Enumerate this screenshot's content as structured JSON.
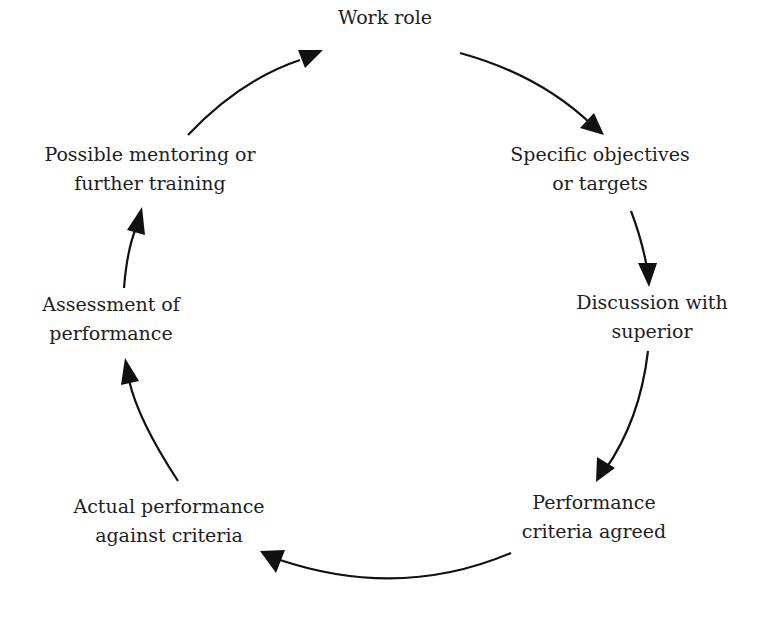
{
  "diagram": {
    "type": "cycle",
    "colors": {
      "background": "#ffffff",
      "text": "#1e1e1e",
      "arrow": "#111111"
    },
    "nodes": [
      {
        "id": "work-role",
        "lines": [
          "Work role"
        ]
      },
      {
        "id": "specific-objectives",
        "lines": [
          "Specific objectives",
          "or targets"
        ]
      },
      {
        "id": "discussion-superior",
        "lines": [
          "Discussion with",
          "superior"
        ]
      },
      {
        "id": "performance-criteria",
        "lines": [
          "Performance",
          "criteria agreed"
        ]
      },
      {
        "id": "actual-performance",
        "lines": [
          "Actual performance",
          "against criteria"
        ]
      },
      {
        "id": "assessment",
        "lines": [
          "Assessment of",
          "performance"
        ]
      },
      {
        "id": "mentoring",
        "lines": [
          "Possible mentoring or",
          "further training"
        ]
      }
    ],
    "edges": [
      {
        "from": "work-role",
        "to": "specific-objectives"
      },
      {
        "from": "specific-objectives",
        "to": "discussion-superior"
      },
      {
        "from": "discussion-superior",
        "to": "performance-criteria"
      },
      {
        "from": "performance-criteria",
        "to": "actual-performance"
      },
      {
        "from": "actual-performance",
        "to": "assessment"
      },
      {
        "from": "assessment",
        "to": "mentoring"
      },
      {
        "from": "mentoring",
        "to": "work-role"
      }
    ]
  }
}
